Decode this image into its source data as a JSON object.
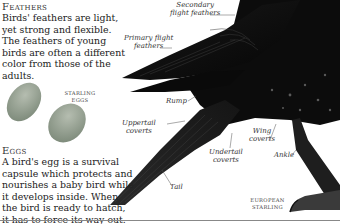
{
  "feathers": {
    "heading": "Feathers",
    "text": "Birds' feathers are light, yet strong and flexible. The feathers of young birds are often a different color from those of the adults."
  },
  "eggs": {
    "caption_line1": "Starling",
    "caption_line2": "eggs",
    "heading": "Eggs",
    "text": "A bird's egg is a survival capsule which protects and nourishes a baby bird while it develops inside. When the bird is ready to hatch, it has to force its way out.",
    "color": "#9aa596"
  },
  "diagram": {
    "labels": {
      "secondary_line1": "Secondary",
      "secondary_line2": "flight feathers",
      "primary_line1": "Primary flight",
      "primary_line2": "feathers",
      "rump": "Rump",
      "uppertail_line1": "Uppertail",
      "uppertail_line2": "coverts",
      "undertail_line1": "Undertail",
      "undertail_line2": "coverts",
      "wing_line1": "Wing",
      "wing_line2": "coverts",
      "ankle": "Ankle",
      "tail": "Tail"
    },
    "caption_line1": "European",
    "caption_line2": "starling",
    "bird_color": "#111111"
  }
}
